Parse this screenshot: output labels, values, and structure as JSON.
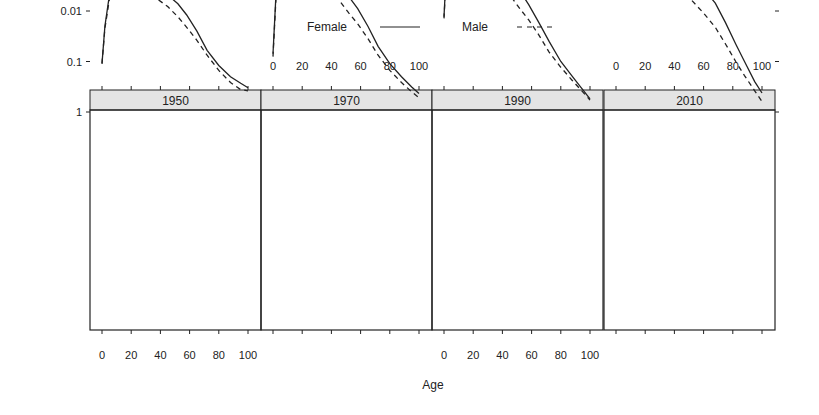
{
  "chart_data": {
    "type": "line",
    "title": "",
    "xlabel": "Age",
    "ylabel": "",
    "yscale": "log",
    "ylim": [
      5e-05,
      1
    ],
    "xlim": [
      -8,
      108
    ],
    "yticks": [
      1,
      0.1,
      0.01,
      0.001,
      0.0001
    ],
    "ytick_labels": [
      "1",
      "0.1",
      "0.01",
      "0.001",
      "1e−04"
    ],
    "xticks": [
      0,
      20,
      40,
      60,
      80,
      100
    ],
    "xtick_labels": [
      "0",
      "20",
      "40",
      "60",
      "80",
      "100"
    ],
    "legend": [
      {
        "name": "Female",
        "style": "solid"
      },
      {
        "name": "Male",
        "style": "dashed"
      }
    ],
    "legend_position": "top",
    "panels": [
      {
        "strip": "1950",
        "x": [
          0,
          2,
          5,
          8,
          12,
          15,
          18,
          22,
          30,
          38,
          45,
          52,
          58,
          65,
          72,
          80,
          88,
          95,
          100
        ],
        "series": [
          {
            "name": "Female",
            "values": [
              0.11,
              0.02,
              0.005,
              0.0019,
              0.0013,
              0.0016,
              0.0025,
              0.003,
              0.0032,
              0.0036,
              0.0048,
              0.0072,
              0.012,
              0.025,
              0.06,
              0.12,
              0.2,
              0.27,
              0.33
            ]
          },
          {
            "name": "Male",
            "values": [
              0.11,
              0.022,
              0.006,
              0.0022,
              0.0011,
              0.0017,
              0.003,
              0.0042,
              0.0047,
              0.0058,
              0.0082,
              0.013,
              0.021,
              0.038,
              0.075,
              0.15,
              0.26,
              0.36,
              0.38
            ]
          }
        ]
      },
      {
        "strip": "1970",
        "x": [
          0,
          2,
          5,
          8,
          12,
          15,
          18,
          22,
          30,
          38,
          45,
          52,
          58,
          65,
          72,
          80,
          88,
          95,
          100
        ],
        "series": [
          {
            "name": "Female",
            "values": [
              0.07,
              0.005,
              0.0015,
              0.0007,
              0.00045,
              0.00048,
              0.00062,
              0.0008,
              0.0011,
              0.0018,
              0.003,
              0.0052,
              0.009,
              0.02,
              0.05,
              0.11,
              0.2,
              0.32,
              0.43
            ]
          },
          {
            "name": "Male",
            "values": [
              0.08,
              0.006,
              0.0018,
              0.0009,
              0.0007,
              0.00095,
              0.0014,
              0.0017,
              0.0022,
              0.0035,
              0.006,
              0.011,
              0.018,
              0.035,
              0.075,
              0.15,
              0.26,
              0.4,
              0.52
            ]
          }
        ]
      },
      {
        "strip": "1990",
        "x": [
          0,
          2,
          5,
          8,
          12,
          15,
          18,
          22,
          30,
          38,
          45,
          52,
          58,
          65,
          72,
          80,
          88,
          95,
          100
        ],
        "series": [
          {
            "name": "Female",
            "values": [
              0.013,
              0.0009,
              0.00045,
              0.0003,
              0.00028,
              0.00035,
              0.0005,
              0.00062,
              0.0008,
              0.0013,
              0.0022,
              0.004,
              0.0075,
              0.017,
              0.04,
              0.1,
              0.2,
              0.36,
              0.55
            ]
          },
          {
            "name": "Male",
            "values": [
              0.014,
              0.001,
              0.0005,
              0.00035,
              0.0004,
              0.0006,
              0.0015,
              0.0019,
              0.0021,
              0.003,
              0.0048,
              0.009,
              0.015,
              0.03,
              0.065,
              0.13,
              0.24,
              0.4,
              0.58
            ]
          }
        ]
      },
      {
        "strip": "2010",
        "x": [
          0,
          2,
          5,
          8,
          12,
          15,
          18,
          22,
          28,
          35,
          45,
          52,
          60,
          68,
          75,
          82,
          88,
          95,
          100
        ],
        "series": [
          {
            "name": "Female",
            "values": [
              0.0028,
              0.00018,
              0.00014,
              0.0001,
              8e-05,
              0.00015,
              0.00022,
              0.00032,
              0.00028,
              0.0006,
              0.0013,
              0.0022,
              0.0036,
              0.007,
              0.017,
              0.045,
              0.1,
              0.25,
              0.42
            ]
          },
          {
            "name": "Male",
            "values": [
              0.003,
              0.0002,
              0.00014,
              0.00015,
              0.0002,
              0.0004,
              0.00068,
              0.00075,
              0.0011,
              0.0018,
              0.0036,
              0.0062,
              0.011,
              0.021,
              0.045,
              0.1,
              0.19,
              0.38,
              0.62
            ]
          }
        ]
      }
    ]
  },
  "layout": {
    "plot_top": 112,
    "plot_bottom": 330,
    "strip_top": 90,
    "panels_left": [
      90,
      261,
      432,
      604
    ],
    "panel_width": 171,
    "x0_offset": 12,
    "px_per_year": 1.46,
    "px_per_decade": 50.5,
    "y_at_1": 112,
    "strip_color": "#e4e4e4",
    "line_color": "#222222"
  }
}
